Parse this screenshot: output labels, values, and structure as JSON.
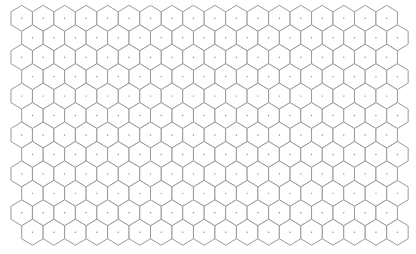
{
  "grid": {
    "type": "hexagonal",
    "orientation": "pointy-top",
    "rows": 12,
    "columns": 18,
    "odd_row_offset": "right",
    "origin": {
      "x": 21.7,
      "y": 18.3
    },
    "col_pitch": 21.47,
    "row_pitch": 19.45,
    "half_width": 10.73,
    "vertical_radius": 12.97,
    "colors": {
      "background": "#ffffff",
      "cell_fill": "#ffffff",
      "cell_stroke": "#9a9a9a",
      "center_dot": "#8a8a8a"
    },
    "center_dot_radius": 0.7
  }
}
